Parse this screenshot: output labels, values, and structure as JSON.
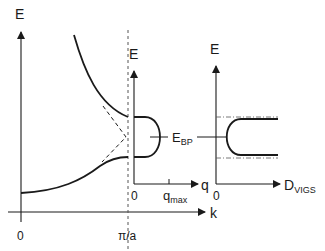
{
  "diagram": {
    "left_panel": {
      "y_axis_label": "E",
      "x_axis_label": "k",
      "x_ticks": [
        "0",
        "π/a"
      ],
      "curves": [
        "upper-band",
        "lower-band",
        "extrapolated-dashed-crossing"
      ]
    },
    "middle_panel": {
      "y_axis_label": "E",
      "x_axis_label": "q",
      "origin_label": "0",
      "tick_label_main": "q",
      "tick_label_sub": "max",
      "marker_label_main": "E",
      "marker_label_sub": "BP"
    },
    "right_panel": {
      "y_axis_label": "E",
      "x_axis_label_main": "D",
      "x_axis_label_sub": "VIGS",
      "origin_label": "0"
    },
    "colors": {
      "line": "#1a1a1a",
      "background": "#ffffff"
    }
  }
}
